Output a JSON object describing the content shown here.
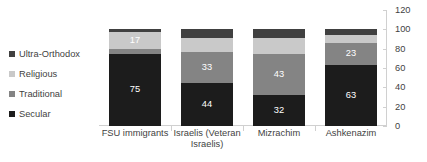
{
  "chart_data": {
    "type": "bar",
    "stacked": true,
    "title": "",
    "xlabel": "",
    "ylabel": "",
    "ylim": [
      0,
      120
    ],
    "ytick_step": 20,
    "ytick_labels": [
      "0",
      "20",
      "40",
      "60",
      "80",
      "100",
      "120"
    ],
    "grid": false,
    "axis_position": "right",
    "legend_position": "left",
    "categories": [
      "FSU immigrants",
      "Israelis (Veteran Israelis)",
      "Mizrachim",
      "Ashkenazim"
    ],
    "category_lines": [
      [
        "FSU immigrants"
      ],
      [
        "Israelis (Veteran",
        "Israelis)"
      ],
      [
        "Mizrachim"
      ],
      [
        "Ashkenazim"
      ]
    ],
    "series": [
      {
        "name": "Secular",
        "color": "#1c1c1c",
        "values": [
          75,
          44,
          32,
          63
        ],
        "labels": [
          "75",
          "44",
          "32",
          "63"
        ]
      },
      {
        "name": "Traditional",
        "color": "#848484",
        "values": [
          5,
          33,
          43,
          23
        ],
        "labels": [
          "",
          "33",
          "43",
          "23"
        ]
      },
      {
        "name": "Religious",
        "color": "#c9c9c9",
        "values": [
          17,
          14,
          16,
          8
        ],
        "labels": [
          "17",
          "",
          "",
          ""
        ]
      },
      {
        "name": "Ultra-Orthodox",
        "color": "#404040",
        "values": [
          3,
          9,
          9,
          6
        ],
        "labels": [
          "",
          "",
          "",
          ""
        ]
      }
    ],
    "legend_entries": [
      {
        "label": "Ultra-Orthodox",
        "color": "#404040"
      },
      {
        "label": "Religious",
        "color": "#c9c9c9"
      },
      {
        "label": "Traditional",
        "color": "#848484"
      },
      {
        "label": "Secular",
        "color": "#1c1c1c"
      }
    ]
  }
}
